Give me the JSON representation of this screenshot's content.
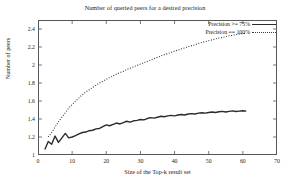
{
  "chart_data": {
    "type": "line",
    "title": "Number of queried peers for a desired precision",
    "xlabel": "Size of the Top-k result set",
    "ylabel": "Number of peers",
    "xlim": [
      0,
      70
    ],
    "ylim": [
      1,
      2.5
    ],
    "xticks": [
      0,
      10,
      20,
      30,
      40,
      50,
      60,
      70
    ],
    "xtick_labels": [
      "0",
      "10",
      "20",
      "30",
      "40",
      "50",
      "60",
      "70"
    ],
    "yticks": [
      1,
      1.2,
      1.4,
      1.6,
      1.8,
      2,
      2.2,
      2.4
    ],
    "ytick_labels": [
      "1",
      "1.2",
      "1.4",
      "1.6",
      "1.8",
      "2",
      "2.2",
      "2.4"
    ],
    "grid": false,
    "legend_position": "top-right",
    "series": [
      {
        "name": "Precision >= 75%",
        "style": "solid",
        "color": "#2b2b2b",
        "x": [
          2,
          3,
          4,
          5,
          6,
          7,
          8,
          9,
          10,
          11,
          12,
          13,
          14,
          15,
          16,
          17,
          18,
          19,
          20,
          21,
          22,
          23,
          24,
          25,
          26,
          27,
          28,
          29,
          30,
          31,
          32,
          33,
          34,
          35,
          36,
          37,
          38,
          39,
          40,
          41,
          42,
          43,
          44,
          45,
          46,
          47,
          48,
          49,
          50,
          51,
          52,
          53,
          54,
          55,
          56,
          57,
          58,
          59,
          60,
          61
        ],
        "values": [
          1.06,
          1.15,
          1.12,
          1.21,
          1.14,
          1.19,
          1.24,
          1.19,
          1.2,
          1.215,
          1.235,
          1.25,
          1.255,
          1.27,
          1.275,
          1.29,
          1.295,
          1.315,
          1.335,
          1.325,
          1.34,
          1.355,
          1.345,
          1.36,
          1.375,
          1.365,
          1.38,
          1.385,
          1.395,
          1.39,
          1.405,
          1.415,
          1.41,
          1.42,
          1.43,
          1.425,
          1.435,
          1.44,
          1.435,
          1.445,
          1.45,
          1.445,
          1.455,
          1.46,
          1.455,
          1.465,
          1.47,
          1.465,
          1.472,
          1.478,
          1.472,
          1.48,
          1.485,
          1.478,
          1.485,
          1.49,
          1.483,
          1.488,
          1.492,
          1.487
        ]
      },
      {
        "name": "Precision == 100%",
        "style": "dotted",
        "color": "#3a3a3a",
        "x": [
          3,
          4,
          5,
          6,
          7,
          8,
          9,
          10,
          11,
          12,
          13,
          14,
          15,
          16,
          17,
          18,
          19,
          20,
          21,
          22,
          23,
          24,
          25,
          26,
          27,
          28,
          29,
          30,
          31,
          32,
          33,
          34,
          35,
          36,
          37,
          38,
          39,
          40,
          41,
          42,
          43,
          44,
          45,
          46,
          47,
          48,
          49,
          50,
          51,
          52,
          53,
          54,
          55,
          56,
          57,
          58,
          59,
          60,
          61
        ],
        "values": [
          1.2,
          1.25,
          1.31,
          1.37,
          1.42,
          1.47,
          1.52,
          1.56,
          1.6,
          1.635,
          1.67,
          1.7,
          1.725,
          1.75,
          1.775,
          1.8,
          1.82,
          1.84,
          1.86,
          1.88,
          1.9,
          1.915,
          1.93,
          1.95,
          1.965,
          1.98,
          1.995,
          2.01,
          2.025,
          2.04,
          2.055,
          2.07,
          2.085,
          2.1,
          2.115,
          2.125,
          2.14,
          2.155,
          2.165,
          2.18,
          2.19,
          2.205,
          2.215,
          2.225,
          2.24,
          2.25,
          2.26,
          2.27,
          2.28,
          2.29,
          2.3,
          2.305,
          2.315,
          2.325,
          2.33,
          2.338,
          2.344,
          2.35,
          2.352
        ]
      }
    ]
  }
}
